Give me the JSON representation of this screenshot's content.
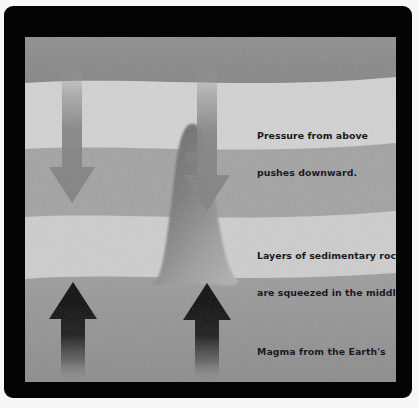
{
  "image": {
    "kind": "cross-section-diagram",
    "subject": "Formation of a dome / mountain by magma pressure and sedimentary rock layers",
    "frame_color": "#040404",
    "page_background": "#f7f7f7"
  },
  "captions": [
    {
      "id": "pressure",
      "name": "caption-pressure-from-above",
      "line1": "Pressure from above",
      "line2": "pushes downward.",
      "color": "#17171c"
    },
    {
      "id": "layers",
      "name": "caption-layers-of-sedimentary-rock",
      "line1": "Layers of sedimentary rock",
      "line2": "are squeezed in the middle.",
      "color": "#17171c"
    },
    {
      "id": "magma",
      "name": "caption-magma-from-earths-crust",
      "line1": "Magma from the Earth's",
      "line2": "crust pushes upward.",
      "color": "#17171c"
    }
  ],
  "rock_layers": [
    {
      "name": "layer-top-dark",
      "order": 1,
      "color": "#8a8a8a",
      "label": "uppermost dark band"
    },
    {
      "name": "layer-pale-upper",
      "order": 2,
      "color": "#d2d2d2",
      "label": "pale sedimentary band"
    },
    {
      "name": "layer-mid-gray",
      "order": 3,
      "color": "#a3a3a3",
      "label": "mid gray band"
    },
    {
      "name": "layer-pale-lower",
      "order": 4,
      "color": "#cfcfcf",
      "label": "pale squeezed band"
    },
    {
      "name": "layer-bottom-gray",
      "order": 5,
      "color": "#9a9a9a",
      "label": "lower gray band"
    },
    {
      "name": "layer-base-shadow",
      "order": 6,
      "color": "#8d8d8d",
      "label": "base shading"
    }
  ],
  "dome": {
    "name": "central-rock-dome",
    "color_top": "#6f6f6f",
    "color_base": "#a8a8a8",
    "description": "Narrow peaked dome of uplifted rock at centre"
  },
  "arrows": {
    "downward": [
      {
        "name": "down-arrow-left",
        "color": "#878787",
        "direction": "down"
      },
      {
        "name": "down-arrow-right",
        "color": "#878787",
        "direction": "down"
      }
    ],
    "upward": [
      {
        "name": "up-arrow-left",
        "color": "#121212",
        "direction": "up"
      },
      {
        "name": "up-arrow-right",
        "color": "#121212",
        "direction": "up"
      }
    ]
  }
}
